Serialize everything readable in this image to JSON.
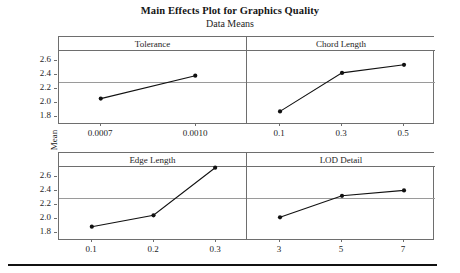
{
  "titles": {
    "main": "Main Effects Plot for Graphics Quality",
    "sub": "Data Means"
  },
  "axis": {
    "ylabel": "Mean",
    "yticks": [
      "2.6",
      "2.4",
      "2.2",
      "2.0",
      "1.8"
    ]
  },
  "chart_data": {
    "type": "line",
    "title": "Main Effects Plot for Graphics Quality",
    "subtitle": "Data Means",
    "ylabel": "Mean",
    "xlabel": "",
    "ylim": [
      1.7,
      2.74
    ],
    "grid": false,
    "reference_line": 2.14,
    "legend": "none",
    "panels": [
      {
        "name": "Tolerance",
        "row": 0,
        "col": 0,
        "categories": [
          "0.0007",
          "0.0010"
        ],
        "values": [
          1.97,
          2.31
        ]
      },
      {
        "name": "Chord Length",
        "row": 0,
        "col": 1,
        "categories": [
          "0.1",
          "0.3",
          "0.5"
        ],
        "values": [
          1.78,
          2.35,
          2.47
        ]
      },
      {
        "name": "Edge Length",
        "row": 1,
        "col": 0,
        "categories": [
          "0.1",
          "0.2",
          "0.3"
        ],
        "values": [
          1.79,
          1.96,
          2.67
        ]
      },
      {
        "name": "LOD Detail",
        "row": 1,
        "col": 1,
        "categories": [
          "3",
          "5",
          "7"
        ],
        "values": [
          1.93,
          2.25,
          2.33
        ]
      }
    ]
  }
}
